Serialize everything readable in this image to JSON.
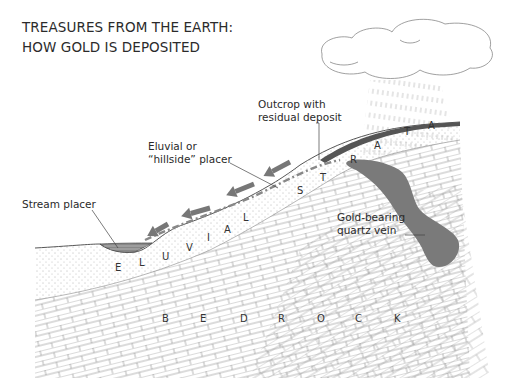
{
  "title": {
    "line1": "TREASURES FROM THE EARTH:",
    "line2": "HOW GOLD IS DEPOSITED"
  },
  "labels": {
    "outcrop_line1": "Outcrop with",
    "outcrop_line2": "residual deposit",
    "eluvial_line1": "Eluvial or",
    "eluvial_line2": "“hillside” placer",
    "stream_placer": "Stream placer",
    "vein_line1": "Gold-bearing",
    "vein_line2": "quartz vein"
  },
  "eluvial_strata_letters": [
    "E",
    "L",
    "U",
    "V",
    "I",
    "A",
    "L",
    "S",
    "T",
    "R",
    "A",
    "T",
    "A"
  ],
  "bedrock_letters": [
    "B",
    "E",
    "D",
    "R",
    "O",
    "C",
    "K"
  ],
  "colors": {
    "ink": "#2a2a2a",
    "gold_vein": "#7a7a7a",
    "arrow": "#777777",
    "sediment_dots": "#555555",
    "line": "#555555"
  },
  "elements": {
    "cloud": "rain-cloud",
    "arrows_count": 4
  }
}
